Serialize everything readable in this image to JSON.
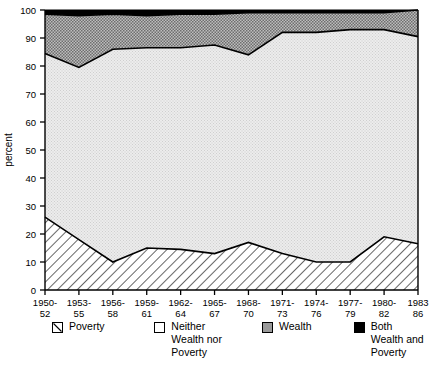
{
  "chart_data": {
    "type": "area",
    "title": "",
    "subtitle": "",
    "xlabel": "",
    "ylabel": "percent",
    "ylim": [
      0,
      100
    ],
    "yticks": [
      0,
      10,
      20,
      30,
      40,
      50,
      60,
      70,
      80,
      90,
      100
    ],
    "grid": false,
    "stacked": true,
    "legend_position": "bottom",
    "categories": [
      "1950-\n52",
      "1953-\n55",
      "1956-\n58",
      "1959-\n61",
      "1962-\n64",
      "1965-\n67",
      "1968-\n70",
      "1971-\n73",
      "1974-\n76",
      "1977-\n79",
      "1980-\n82",
      "1983\n86"
    ],
    "series": [
      {
        "name": "Poverty",
        "fill": "hatch",
        "values": [
          26,
          18,
          10,
          15,
          14.5,
          13,
          17,
          13,
          10,
          10,
          19,
          16.5
        ]
      },
      {
        "name": "Neither Wealth nor Poverty",
        "fill": "white",
        "values": [
          58.5,
          61.5,
          76,
          71.5,
          72,
          74.5,
          67,
          79,
          82,
          83,
          74,
          74
        ]
      },
      {
        "name": "Wealth",
        "fill": "gray",
        "values": [
          14,
          18.5,
          12.5,
          11.5,
          12,
          11,
          15,
          7,
          7,
          6,
          6,
          9.5
        ]
      },
      {
        "name": "Both Wealth and Poverty",
        "fill": "black",
        "values": [
          1.5,
          2,
          1.5,
          2,
          1.5,
          1.5,
          1,
          1,
          1,
          1,
          1,
          0
        ]
      }
    ],
    "cumulative_upper_bounds": {
      "poverty_top": [
        26,
        18,
        10,
        15,
        14.5,
        13,
        17,
        13,
        10,
        10,
        19,
        16.5
      ],
      "neither_top": [
        84.5,
        79.5,
        86,
        86.5,
        86.5,
        87.5,
        84,
        92,
        92,
        93,
        93,
        90.5
      ],
      "wealth_top": [
        98.5,
        98,
        98.5,
        98,
        98.5,
        98.5,
        99,
        99,
        99,
        99,
        99,
        100
      ]
    }
  },
  "axis": {
    "y_title": "percent",
    "y_ticks": [
      "0",
      "10",
      "20",
      "30",
      "40",
      "50",
      "60",
      "70",
      "80",
      "90",
      "100"
    ],
    "x_ticks": [
      {
        "line1": "1950-",
        "line2": "52"
      },
      {
        "line1": "1953-",
        "line2": "55"
      },
      {
        "line1": "1956-",
        "line2": "58"
      },
      {
        "line1": "1959-",
        "line2": "61"
      },
      {
        "line1": "1962-",
        "line2": "64"
      },
      {
        "line1": "1965-",
        "line2": "67"
      },
      {
        "line1": "1968-",
        "line2": "70"
      },
      {
        "line1": "1971-",
        "line2": "73"
      },
      {
        "line1": "1974-",
        "line2": "76"
      },
      {
        "line1": "1977-",
        "line2": "79"
      },
      {
        "line1": "1980-",
        "line2": "82"
      },
      {
        "line1": "1983",
        "line2": "86"
      }
    ]
  },
  "legend": {
    "entries": [
      {
        "label": "Poverty",
        "swatch": "hatch-swatch",
        "color": "#ffffff"
      },
      {
        "label": "Neither\nWealth nor\nPoverty",
        "swatch": "white-swatch",
        "color": "#ffffff"
      },
      {
        "label": "Wealth",
        "swatch": "gray-swatch",
        "color": "#9a9a9a"
      },
      {
        "label": "Both\nWealth and\nPoverty",
        "swatch": "black-swatch",
        "color": "#000000"
      }
    ]
  },
  "colors": {
    "poverty": "#ffffff",
    "neither": "#e3e3e3",
    "wealth": "#9a9a9a",
    "both": "#000000",
    "outline": "#000000",
    "background": "#ffffff"
  }
}
